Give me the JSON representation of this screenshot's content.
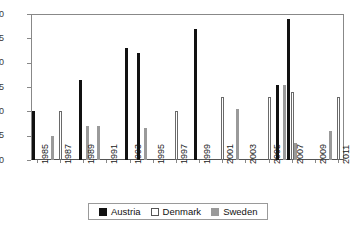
{
  "chart_data": {
    "type": "bar",
    "title": "",
    "subtitle": "",
    "xlabel": "",
    "ylabel": "",
    "ylim": [
      0,
      30
    ],
    "yticks": [
      0,
      5,
      10,
      15,
      20,
      25,
      30
    ],
    "grid": false,
    "legend_position": "bottom",
    "categories": [
      "1985",
      "1986",
      "1987",
      "1988",
      "1989",
      "1990",
      "1991",
      "1992",
      "1993",
      "1994",
      "1995",
      "1996",
      "1997",
      "1998",
      "1999",
      "2000",
      "2001",
      "2002",
      "2003",
      "2004",
      "2005",
      "2006",
      "2007",
      "2008",
      "2009",
      "2010",
      "2011"
    ],
    "xtick_labels": [
      "1985",
      "1987",
      "1989",
      "1991",
      "1993",
      "1995",
      "1997",
      "1999",
      "2001",
      "2003",
      "2005",
      "2007",
      "2009",
      "2011"
    ],
    "series": [
      {
        "name": "Austria",
        "color": "#111111",
        "values": [
          10,
          0,
          0,
          0,
          16.5,
          0,
          0,
          0,
          23,
          22,
          0,
          0,
          0,
          0,
          27,
          0,
          0,
          0,
          0,
          0,
          0,
          15.5,
          29,
          0,
          0,
          0,
          0
        ]
      },
      {
        "name": "Denmark",
        "color": "#ffffff",
        "values": [
          0,
          0,
          10,
          0,
          0,
          0,
          0,
          0,
          0,
          0,
          0,
          0,
          10,
          0,
          0,
          0,
          13,
          0,
          0,
          0,
          13,
          0,
          14,
          0,
          0,
          0,
          13
        ]
      },
      {
        "name": "Sweden",
        "color": "#9a9a9a",
        "values": [
          0,
          5,
          0,
          0,
          7,
          7,
          0,
          0,
          0,
          6.5,
          0,
          0,
          0,
          0,
          0,
          0,
          0,
          10.5,
          0,
          0,
          0,
          15.5,
          3.5,
          0,
          0,
          6,
          0
        ]
      }
    ]
  },
  "legend": {
    "items": [
      {
        "label": "Austria",
        "swatch": "austria"
      },
      {
        "label": "Denmark",
        "swatch": "denmark"
      },
      {
        "label": "Sweden",
        "swatch": "sweden"
      }
    ]
  }
}
